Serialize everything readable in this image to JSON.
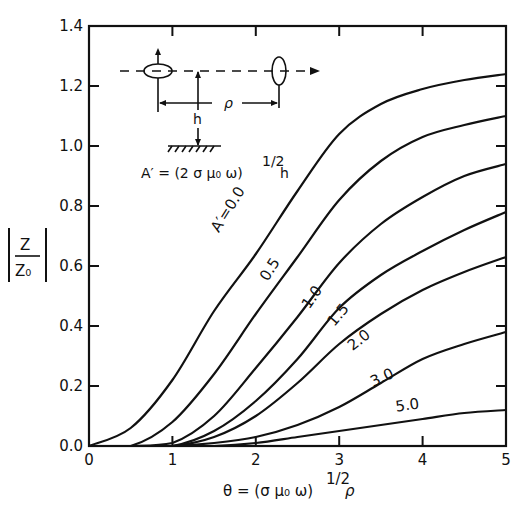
{
  "chart_data": {
    "type": "line",
    "title": "",
    "xlabel": "θ = (σμ₀ω)^½ ρ",
    "ylabel": "|Z/Z₀|",
    "xlim": [
      0,
      5
    ],
    "ylim": [
      0,
      1.4
    ],
    "xticks": [
      "0",
      "1",
      "2",
      "3",
      "4",
      "5"
    ],
    "yticks": [
      "0.0",
      "0.2",
      "0.4",
      "0.6",
      "0.8",
      "1.0",
      "1.2",
      "1.4"
    ],
    "grid": false,
    "legend_position": "inline curve labels",
    "x": [
      0,
      0.5,
      1.0,
      1.5,
      2.0,
      2.5,
      3.0,
      3.5,
      4.0,
      4.5,
      5.0
    ],
    "series": [
      {
        "name": "A′=0.0",
        "label": "A′=0.0",
        "values": [
          0.0,
          0.06,
          0.22,
          0.45,
          0.64,
          0.85,
          1.04,
          1.14,
          1.19,
          1.22,
          1.24
        ]
      },
      {
        "name": "0.5",
        "label": "0.5",
        "values": [
          0.0,
          0.0,
          0.08,
          0.24,
          0.44,
          0.63,
          0.82,
          0.95,
          1.03,
          1.07,
          1.1
        ]
      },
      {
        "name": "1.0",
        "label": "1.0",
        "values": [
          0.0,
          0.0,
          0.01,
          0.1,
          0.26,
          0.43,
          0.61,
          0.74,
          0.83,
          0.9,
          0.94
        ]
      },
      {
        "name": "1.5",
        "label": "1.5",
        "values": [
          0.0,
          0.0,
          0.0,
          0.05,
          0.15,
          0.29,
          0.46,
          0.57,
          0.65,
          0.72,
          0.78
        ]
      },
      {
        "name": "2.0",
        "label": "2.0",
        "values": [
          0.0,
          0.0,
          0.0,
          0.03,
          0.1,
          0.21,
          0.34,
          0.44,
          0.52,
          0.58,
          0.63
        ]
      },
      {
        "name": "3.0",
        "label": "3.0",
        "values": [
          0.0,
          0.0,
          0.0,
          0.01,
          0.03,
          0.07,
          0.13,
          0.21,
          0.29,
          0.34,
          0.38
        ]
      },
      {
        "name": "5.0",
        "label": "5.0",
        "values": [
          0.0,
          0.0,
          0.0,
          0.0,
          0.01,
          0.03,
          0.05,
          0.07,
          0.09,
          0.11,
          0.12
        ]
      }
    ],
    "annotations": [
      "Inset diagram: two coil loops along dashed line at height h above ground, separated by ρ",
      "A′ = (2σμ₀ω)^½ h"
    ]
  },
  "inset": {
    "rho_label": "ρ",
    "h_label": "h",
    "formula": "A′ = (2 σ μ₀ ω)",
    "formula_exp": "1/2",
    "formula_tail": "h"
  },
  "axis_text": {
    "ylabel_top": "Z",
    "ylabel_bottom": "Z₀",
    "xlabel_main": "θ = (σ μ₀ ω)",
    "xlabel_exp": "1/2",
    "xlabel_tail": "ρ"
  }
}
